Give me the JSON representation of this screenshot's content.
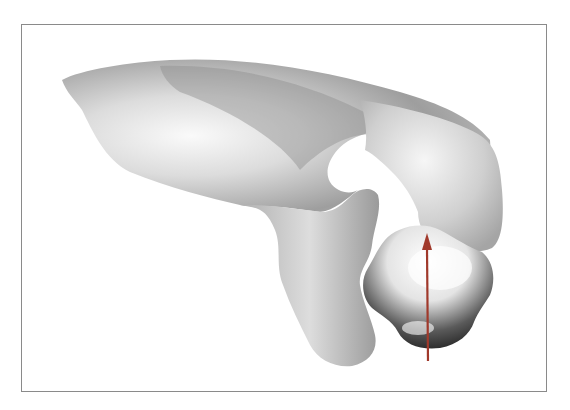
{
  "figure": {
    "frame": {
      "border_color": "#8a8a8a",
      "background": "#ffffff"
    },
    "arrow": {
      "color": "#a0392b",
      "direction": "up"
    },
    "shading_colors": {
      "light": "#f4f4f4",
      "mid": "#bdbdbd",
      "dark": "#3a3a3a"
    }
  }
}
